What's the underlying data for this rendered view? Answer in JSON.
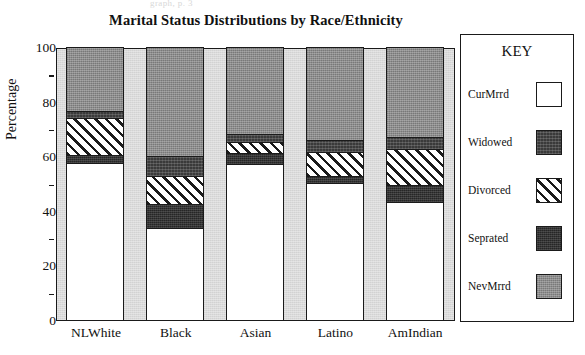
{
  "scan_artifact_text": "graph, p. 3",
  "chart_title": "Marital Status Distributions by Race/Ethnicity",
  "legend": {
    "title": "KEY",
    "items": [
      {
        "label": "CurMrrd",
        "swatch": "white-square-icon",
        "color": "#ffffff"
      },
      {
        "label": "Widowed",
        "swatch": "dark-square-icon",
        "color": "#3a3a3a"
      },
      {
        "label": "Divorced",
        "swatch": "diagonal-hatch-icon",
        "color": "#ffffff"
      },
      {
        "label": "Seprated",
        "swatch": "very-dark-square-icon",
        "color": "#262626"
      },
      {
        "label": "NevMrrd",
        "swatch": "gray-square-icon",
        "color": "#8c8c8c"
      }
    ]
  },
  "axis": {
    "y_title": "Percentage",
    "y_major_ticks": [
      "100",
      "80",
      "60",
      "40",
      "20",
      "0"
    ],
    "y_minor_ticks": [
      "90",
      "70",
      "50",
      "30",
      "10"
    ]
  },
  "chart_data": {
    "type": "bar",
    "stacked": true,
    "title": "Marital Status Distributions by Race/Ethnicity",
    "xlabel": "",
    "ylabel": "Percentage",
    "ylim": [
      0,
      100
    ],
    "yticks": [
      0,
      20,
      40,
      60,
      80,
      100
    ],
    "grid": false,
    "legend_position": "right",
    "categories": [
      "NLWhite",
      "Black",
      "Asian",
      "Latino",
      "AmIndian"
    ],
    "stack_order_bottom_to_top": [
      "CurMrrd",
      "Seprated",
      "Divorced",
      "Widowed",
      "NevMrrd"
    ],
    "series": [
      {
        "name": "CurMrrd",
        "values": [
          58.3,
          34.0,
          58.0,
          50.6,
          43.5
        ]
      },
      {
        "name": "Seprated",
        "values": [
          2.6,
          8.5,
          3.7,
          2.2,
          6.3
        ]
      },
      {
        "name": "Divorced",
        "values": [
          13.3,
          10.3,
          3.7,
          8.9,
          12.9
        ]
      },
      {
        "name": "Widowed",
        "values": [
          2.2,
          7.0,
          2.6,
          4.0,
          4.1
        ]
      },
      {
        "name": "NevMrrd",
        "values": [
          23.6,
          40.2,
          32.0,
          34.3,
          33.2
        ]
      }
    ],
    "colors": {
      "CurMrrd": "#ffffff",
      "Seprated": "#262626",
      "Divorced": "#ffffff",
      "Widowed": "#3a3a3a",
      "NevMrrd": "#8c8c8c"
    }
  }
}
